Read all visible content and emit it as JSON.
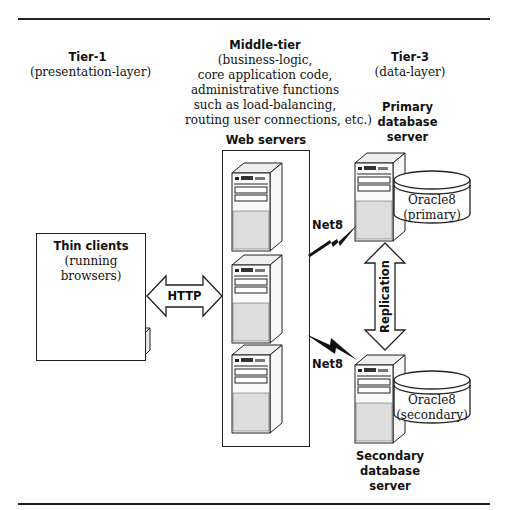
{
  "tiers": {
    "tier1": {
      "title": "Tier-1",
      "subtitle": "(presentation-layer)"
    },
    "middle": {
      "title": "Middle-tier",
      "lines": [
        "(business-logic,",
        "core application code,",
        "administrative functions",
        "such as load-balancing,",
        "routing user connections, etc.)"
      ]
    },
    "tier3": {
      "title": "Tier-3",
      "subtitle": "(data-layer)"
    }
  },
  "thin_clients": {
    "title": "Thin clients",
    "lines": [
      "(running",
      "browsers)"
    ]
  },
  "web_servers": {
    "title": "Web servers",
    "count": 3
  },
  "connectors": {
    "http": "HTTP",
    "net8_top": "Net8",
    "net8_bottom": "Net8",
    "replication": "Replication"
  },
  "primary_db": {
    "title_lines": [
      "Primary",
      "database",
      "server"
    ],
    "db_name": "Oracle8",
    "db_role": "(primary)"
  },
  "secondary_db": {
    "title_lines": [
      "Secondary",
      "database",
      "server"
    ],
    "db_name": "Oracle8",
    "db_role": "(secondary)"
  }
}
